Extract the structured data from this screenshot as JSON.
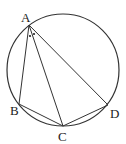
{
  "figure": {
    "type": "inscribed-quadrilateral-diagram",
    "circle": {
      "cx": 63,
      "cy": 70,
      "r": 56
    },
    "points": {
      "A": {
        "label": "A",
        "x": 29,
        "y": 25
      },
      "B": {
        "label": "B",
        "x": 19,
        "y": 104
      },
      "C": {
        "label": "C",
        "x": 63,
        "y": 126
      },
      "D": {
        "label": "D",
        "x": 108,
        "y": 105
      }
    },
    "segments": [
      "AB",
      "AC",
      "AD",
      "BC",
      "CD"
    ],
    "angle_marks": [
      {
        "vertex": "A",
        "between": [
          "AB",
          "AC"
        ],
        "mark": "dot"
      },
      {
        "vertex": "A",
        "between": [
          "AC",
          "AD"
        ],
        "mark": "dot"
      }
    ],
    "colors": {
      "stroke": "#333333",
      "background": "#ffffff"
    }
  }
}
